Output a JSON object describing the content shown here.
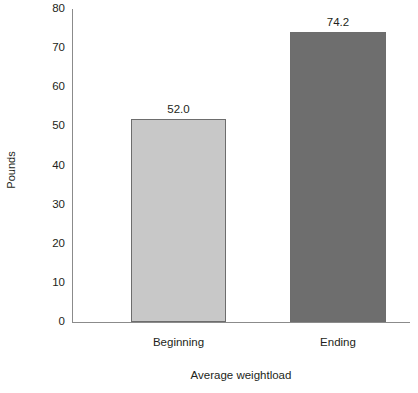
{
  "chart_data": {
    "type": "bar",
    "title": "",
    "subtitle": "",
    "xlabel": "Average weightload",
    "ylabel": "Pounds",
    "categories": [
      "Beginning",
      "Ending"
    ],
    "values": [
      52.0,
      74.2
    ],
    "data_labels": [
      "52.0",
      "74.2"
    ],
    "ylim": [
      0,
      80
    ],
    "yticks": [
      0,
      10,
      20,
      30,
      40,
      50,
      60,
      70,
      80
    ],
    "ytick_labels": [
      "0",
      "10",
      "20",
      "30",
      "40",
      "50",
      "60",
      "70",
      "80"
    ],
    "grid": false,
    "legend": false,
    "legend_position": "none",
    "bar_colors": [
      "#c8c8c8",
      "#6e6e6e"
    ],
    "bar_border_color": "#6d6d6d",
    "axis_color": "#8b8b8b",
    "background_color": "#ffffff",
    "text_color": "#231f20"
  }
}
